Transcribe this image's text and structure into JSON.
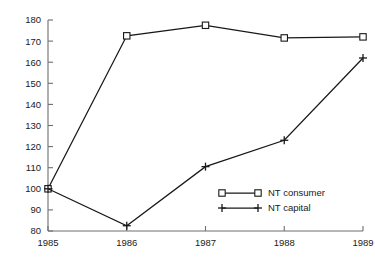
{
  "chart_data": {
    "type": "line",
    "title": "",
    "subtitle": "",
    "xlabel": "",
    "ylabel": "",
    "categories": [
      "1985",
      "1986",
      "1987",
      "1988",
      "1989"
    ],
    "x": [
      1985,
      1986,
      1987,
      1988,
      1989
    ],
    "series": [
      {
        "name": "NT consumer",
        "marker": "square",
        "values": [
          100,
          172.5,
          177.5,
          171.5,
          172
        ]
      },
      {
        "name": "NT capital",
        "marker": "plus",
        "values": [
          100,
          82.5,
          110.5,
          123,
          162
        ]
      }
    ],
    "xlim": [
      1985,
      1989
    ],
    "ylim": [
      80,
      180
    ],
    "ytick_labels": [
      "80",
      "90",
      "100",
      "110",
      "120",
      "130",
      "140",
      "150",
      "160",
      "170",
      "180"
    ],
    "ytick_values": [
      80,
      90,
      100,
      110,
      120,
      130,
      140,
      150,
      160,
      170,
      180
    ],
    "xtick_labels": [
      "1985",
      "1986",
      "1987",
      "1988",
      "1989"
    ],
    "grid": false,
    "legend_position": "inside-lower-right",
    "colors": {
      "line": "#181818",
      "axis": "#6e6e6e",
      "text": "#1a1a1a",
      "background": "#ffffff",
      "marker_fill": "#ffffff"
    }
  },
  "legend": {
    "entries": [
      {
        "label": "NT consumer",
        "marker": "square-marker"
      },
      {
        "label": "NT capital",
        "marker": "plus-marker"
      }
    ]
  }
}
